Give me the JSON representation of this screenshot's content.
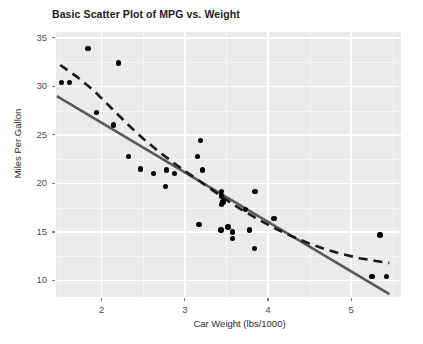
{
  "chart_data": {
    "type": "scatter",
    "title": "Basic Scatter Plot of MPG vs. Weight",
    "xlabel": "Car Weight (lbs/1000)",
    "ylabel": "Miles Per Gallon",
    "xlim": [
      1.45,
      5.6
    ],
    "ylim": [
      8.3,
      35.6
    ],
    "xticks": [
      2,
      3,
      4,
      5
    ],
    "yticks": [
      10,
      15,
      20,
      25,
      30,
      35
    ],
    "xtick_labels": [
      "2",
      "3",
      "4",
      "5"
    ],
    "ytick_labels": [
      "10",
      "15",
      "20",
      "25",
      "30",
      "35"
    ],
    "grid": true,
    "legend": "none",
    "panel_background": "#ebebeb",
    "grid_color": "#ffffff",
    "point_color": "#000000",
    "point_size": 5.4,
    "x": [
      2.62,
      2.875,
      2.32,
      3.215,
      3.44,
      3.46,
      3.57,
      3.19,
      3.15,
      3.44,
      3.44,
      4.07,
      3.73,
      3.78,
      5.25,
      5.424,
      5.345,
      2.2,
      1.615,
      1.835,
      2.465,
      3.52,
      3.435,
      3.84,
      3.845,
      1.935,
      2.14,
      1.513,
      3.17,
      2.77,
      3.57,
      2.78
    ],
    "y": [
      21.0,
      21.0,
      22.8,
      21.4,
      18.7,
      18.1,
      14.3,
      24.4,
      22.8,
      19.2,
      17.8,
      16.4,
      17.3,
      15.2,
      10.4,
      10.4,
      14.7,
      32.4,
      30.4,
      33.9,
      21.5,
      15.5,
      15.2,
      13.3,
      19.2,
      27.3,
      26.0,
      30.4,
      15.8,
      19.7,
      15.0,
      21.4
    ],
    "series": [
      {
        "name": "linear-regression-line",
        "style": "solid",
        "color": "#595959",
        "width": 2.6,
        "points": [
          [
            1.46,
            29.0
          ],
          [
            5.46,
            8.6
          ]
        ]
      },
      {
        "name": "loess-smooth-line",
        "style": "dashed",
        "color": "#1a1a1a",
        "width": 2.6,
        "dasharray": "9,6",
        "points": [
          [
            1.5,
            32.2
          ],
          [
            1.7,
            31.0
          ],
          [
            1.9,
            29.6
          ],
          [
            2.1,
            27.9
          ],
          [
            2.3,
            26.2
          ],
          [
            2.5,
            24.6
          ],
          [
            2.7,
            23.2
          ],
          [
            2.9,
            21.9
          ],
          [
            3.1,
            20.7
          ],
          [
            3.3,
            19.5
          ],
          [
            3.5,
            18.3
          ],
          [
            3.7,
            17.2
          ],
          [
            3.9,
            16.2
          ],
          [
            4.1,
            15.3
          ],
          [
            4.3,
            14.5
          ],
          [
            4.5,
            13.8
          ],
          [
            4.7,
            13.2
          ],
          [
            4.9,
            12.7
          ],
          [
            5.1,
            12.3
          ],
          [
            5.3,
            12.0
          ],
          [
            5.46,
            11.8
          ]
        ]
      }
    ]
  }
}
